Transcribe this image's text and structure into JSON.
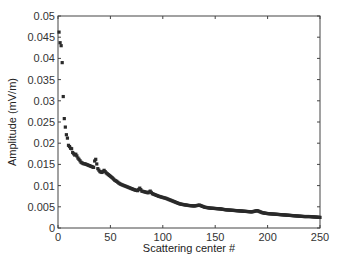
{
  "chart_data": {
    "type": "scatter",
    "title": "",
    "xlabel": "Scattering center #",
    "ylabel": "Amplitude (mV/m)",
    "xlim": [
      0,
      250
    ],
    "ylim": [
      0,
      0.05
    ],
    "xticks": [
      "0",
      "50",
      "100",
      "150",
      "200",
      "250"
    ],
    "yticks": [
      "0",
      "0.005",
      "0.01",
      "0.015",
      "0.02",
      "0.025",
      "0.03",
      "0.035",
      "0.04",
      "0.045",
      "0.05"
    ],
    "grid": false,
    "legend": null,
    "series": [
      {
        "name": "Amplitude",
        "marker": "square",
        "color": "#2a2a2a",
        "points": [
          [
            1,
            0.0462
          ],
          [
            2,
            0.0437
          ],
          [
            3,
            0.043
          ],
          [
            4,
            0.039
          ],
          [
            5,
            0.031
          ],
          [
            6,
            0.0258
          ],
          [
            7,
            0.0238
          ],
          [
            8,
            0.022
          ],
          [
            9,
            0.0212
          ],
          [
            10,
            0.0195
          ],
          [
            11,
            0.0192
          ],
          [
            12,
            0.0188
          ],
          [
            13,
            0.0187
          ],
          [
            14,
            0.0178
          ],
          [
            15,
            0.0175
          ],
          [
            16,
            0.0172
          ],
          [
            17,
            0.0174
          ],
          [
            18,
            0.017
          ],
          [
            19,
            0.0165
          ],
          [
            20,
            0.0162
          ],
          [
            22,
            0.0155
          ],
          [
            24,
            0.0152
          ],
          [
            26,
            0.0151
          ],
          [
            28,
            0.0149
          ],
          [
            30,
            0.0147
          ],
          [
            32,
            0.0145
          ],
          [
            34,
            0.0143
          ],
          [
            35,
            0.0158
          ],
          [
            36,
            0.0162
          ],
          [
            38,
            0.014
          ],
          [
            40,
            0.0133
          ],
          [
            42,
            0.0131
          ],
          [
            44,
            0.0136
          ],
          [
            46,
            0.013
          ],
          [
            48,
            0.0126
          ],
          [
            50,
            0.0122
          ],
          [
            52,
            0.0118
          ],
          [
            54,
            0.0113
          ],
          [
            56,
            0.011
          ],
          [
            58,
            0.0106
          ],
          [
            60,
            0.0103
          ],
          [
            62,
            0.0101
          ],
          [
            65,
            0.0098
          ],
          [
            68,
            0.0095
          ],
          [
            70,
            0.0093
          ],
          [
            73,
            0.009
          ],
          [
            76,
            0.0088
          ],
          [
            78,
            0.0094
          ],
          [
            80,
            0.0087
          ],
          [
            83,
            0.0085
          ],
          [
            86,
            0.0083
          ],
          [
            88,
            0.0087
          ],
          [
            90,
            0.0081
          ],
          [
            93,
            0.0078
          ],
          [
            96,
            0.0075
          ],
          [
            100,
            0.0072
          ],
          [
            103,
            0.007
          ],
          [
            106,
            0.0067
          ],
          [
            110,
            0.0063
          ],
          [
            113,
            0.006
          ],
          [
            116,
            0.0057
          ],
          [
            120,
            0.0055
          ],
          [
            125,
            0.0053
          ],
          [
            130,
            0.0052
          ],
          [
            135,
            0.0054
          ],
          [
            140,
            0.0049
          ],
          [
            145,
            0.0047
          ],
          [
            150,
            0.0046
          ],
          [
            155,
            0.0045
          ],
          [
            160,
            0.0043
          ],
          [
            165,
            0.0042
          ],
          [
            170,
            0.0041
          ],
          [
            175,
            0.004
          ],
          [
            180,
            0.0039
          ],
          [
            185,
            0.0038
          ],
          [
            190,
            0.0041
          ],
          [
            195,
            0.0036
          ],
          [
            200,
            0.0034
          ],
          [
            205,
            0.0033
          ],
          [
            210,
            0.0032
          ],
          [
            215,
            0.0031
          ],
          [
            220,
            0.003
          ],
          [
            225,
            0.0029
          ],
          [
            230,
            0.0028
          ],
          [
            235,
            0.0027
          ],
          [
            240,
            0.0027
          ],
          [
            245,
            0.0026
          ],
          [
            250,
            0.0025
          ]
        ]
      }
    ]
  }
}
